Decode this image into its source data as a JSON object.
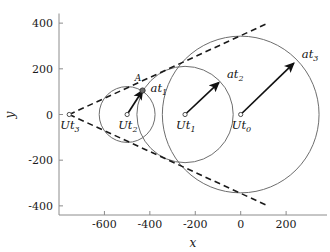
{
  "chart_data": {
    "type": "scatter",
    "title": "",
    "xlabel": "x",
    "ylabel": "y",
    "xlim": [
      -800,
      380
    ],
    "ylim": [
      -440,
      440
    ],
    "xticks": [
      -600,
      -400,
      -200,
      0,
      200
    ],
    "xticklabels": [
      "-600",
      "-400",
      "-200",
      "0",
      "200"
    ],
    "yticks": [
      -400,
      -200,
      0,
      200,
      400
    ],
    "yticklabels": [
      "-400",
      "-200",
      "0",
      "200",
      "400"
    ],
    "grid": false,
    "legend": null,
    "circles": [
      {
        "name": "circle-t0",
        "cx": 0,
        "cy": 0,
        "r": 345
      },
      {
        "name": "circle-t1",
        "cx": -245,
        "cy": 0,
        "r": 212
      },
      {
        "name": "circle-t2",
        "cx": -500,
        "cy": 0,
        "r": 123
      },
      {
        "name": "circle-t3",
        "cx": -755,
        "cy": 0,
        "r": 0
      }
    ],
    "centers": [
      {
        "label": "Ut",
        "sub": "0",
        "x": 0,
        "y": 0
      },
      {
        "label": "Ut",
        "sub": "1",
        "x": -245,
        "y": 0
      },
      {
        "label": "Ut",
        "sub": "2",
        "x": -500,
        "y": 0
      },
      {
        "label": "Ut",
        "sub": "3",
        "x": -755,
        "y": 0
      }
    ],
    "vectors": [
      {
        "label": "at",
        "sub": "3",
        "x0": 0,
        "y0": 0,
        "x1": 234,
        "y1": 225
      },
      {
        "label": "at",
        "sub": "2",
        "x0": -245,
        "y0": 0,
        "x1": -96,
        "y1": 140
      },
      {
        "label": "at",
        "sub": "1",
        "x0": -500,
        "y0": 0,
        "x1": -432,
        "y1": 105
      }
    ],
    "annotations": [
      {
        "name": "point-A",
        "text": "A",
        "x": -452,
        "y": 148
      }
    ],
    "tangents": [
      {
        "name": "upper-tangent",
        "x0": -755,
        "y0": 0,
        "x1": 120,
        "y1": 400
      },
      {
        "name": "lower-tangent",
        "x0": -755,
        "y0": 0,
        "x1": 120,
        "y1": -400
      }
    ],
    "tangent_apex": {
      "x": -755,
      "y": 0
    }
  }
}
